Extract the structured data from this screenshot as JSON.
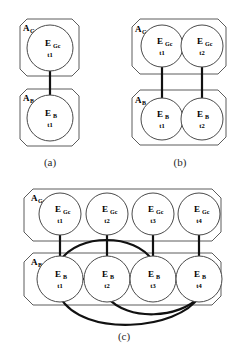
{
  "figure": {
    "colors": {
      "background": "#ffffff",
      "container_stroke": "#5c5c5c",
      "node_stroke": "#4a4a4a",
      "edge": "#111111",
      "text": "#000000",
      "caption": "#2a2a2a"
    },
    "panels": [
      {
        "id": "a",
        "caption": "(a)",
        "containers": [
          {
            "id": "a-agc",
            "label_main": "A",
            "label_sub": "Gc"
          },
          {
            "id": "a-ab",
            "label_main": "A",
            "label_sub": "B"
          }
        ],
        "nodes": [
          {
            "id": "a-egc-t1",
            "label_main": "E",
            "label_sub": "Gc",
            "time": "t1",
            "layer": "Gc"
          },
          {
            "id": "a-eb-t1",
            "label_main": "E",
            "label_sub": "B",
            "time": "t1",
            "layer": "B"
          }
        ],
        "edges": [
          {
            "from": "a-egc-t1",
            "to": "a-eb-t1",
            "kind": "vertical"
          }
        ]
      },
      {
        "id": "b",
        "caption": "(b)",
        "containers": [
          {
            "id": "b-agc",
            "label_main": "A",
            "label_sub": "Gc"
          },
          {
            "id": "b-ab",
            "label_main": "A",
            "label_sub": "B"
          }
        ],
        "nodes": [
          {
            "id": "b-egc-t1",
            "label_main": "E",
            "label_sub": "Gc",
            "time": "t1",
            "layer": "Gc"
          },
          {
            "id": "b-egc-t2",
            "label_main": "E",
            "label_sub": "Gc",
            "time": "t2",
            "layer": "Gc"
          },
          {
            "id": "b-eb-t1",
            "label_main": "E",
            "label_sub": "B",
            "time": "t1",
            "layer": "B"
          },
          {
            "id": "b-eb-t2",
            "label_main": "E",
            "label_sub": "B",
            "time": "t2",
            "layer": "B"
          }
        ],
        "edges": [
          {
            "from": "b-egc-t1",
            "to": "b-eb-t1",
            "kind": "vertical"
          },
          {
            "from": "b-egc-t2",
            "to": "b-eb-t2",
            "kind": "vertical"
          },
          {
            "from": "b-eb-t1",
            "to": "b-eb-t2",
            "kind": "horizontal"
          }
        ]
      },
      {
        "id": "c",
        "caption": "(c)",
        "containers": [
          {
            "id": "c-agc",
            "label_main": "A",
            "label_sub": "Gc"
          },
          {
            "id": "c-ab",
            "label_main": "A",
            "label_sub": "B"
          }
        ],
        "nodes": [
          {
            "id": "c-egc-t1",
            "label_main": "E",
            "label_sub": "Gc",
            "time": "t1",
            "layer": "Gc"
          },
          {
            "id": "c-egc-t2",
            "label_main": "E",
            "label_sub": "Gc",
            "time": "t2",
            "layer": "Gc"
          },
          {
            "id": "c-egc-t3",
            "label_main": "E",
            "label_sub": "Gc",
            "time": "t3",
            "layer": "Gc"
          },
          {
            "id": "c-egc-t4",
            "label_main": "E",
            "label_sub": "Gc",
            "time": "t4",
            "layer": "Gc"
          },
          {
            "id": "c-eb-t1",
            "label_main": "E",
            "label_sub": "B",
            "time": "t1",
            "layer": "B"
          },
          {
            "id": "c-eb-t2",
            "label_main": "E",
            "label_sub": "B",
            "time": "t2",
            "layer": "B"
          },
          {
            "id": "c-eb-t3",
            "label_main": "E",
            "label_sub": "B",
            "time": "t3",
            "layer": "B"
          },
          {
            "id": "c-eb-t4",
            "label_main": "E",
            "label_sub": "B",
            "time": "t4",
            "layer": "B"
          }
        ],
        "edges": [
          {
            "from": "c-egc-t1",
            "to": "c-eb-t1",
            "kind": "vertical"
          },
          {
            "from": "c-egc-t2",
            "to": "c-eb-t2",
            "kind": "vertical"
          },
          {
            "from": "c-egc-t3",
            "to": "c-eb-t3",
            "kind": "vertical"
          },
          {
            "from": "c-egc-t4",
            "to": "c-eb-t4",
            "kind": "vertical"
          },
          {
            "from": "c-eb-t1",
            "to": "c-eb-t2",
            "kind": "horizontal"
          },
          {
            "from": "c-eb-t2",
            "to": "c-eb-t3",
            "kind": "horizontal"
          },
          {
            "from": "c-eb-t3",
            "to": "c-eb-t4",
            "kind": "horizontal"
          },
          {
            "from": "c-eb-t1",
            "to": "c-eb-t3",
            "kind": "arc-above"
          },
          {
            "from": "c-eb-t2",
            "to": "c-eb-t4",
            "kind": "arc-below"
          },
          {
            "from": "c-eb-t1",
            "to": "c-eb-t4",
            "kind": "arc-below"
          }
        ]
      }
    ]
  }
}
